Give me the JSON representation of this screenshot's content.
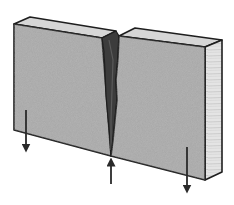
{
  "diagram": {
    "caption": "· · · ·· ·· ··· · ·· ·",
    "caption_note": "",
    "blocks": [
      {
        "name": "left-block",
        "face_color": "#a6a6a6",
        "top_color": "#d4d4d4"
      },
      {
        "name": "right-block",
        "face_color": "#a6a6a6",
        "top_color": "#d4d4d4",
        "side_color": "#e2e2e2"
      }
    ],
    "crack": {
      "color": "#3a3a3a"
    },
    "arrows": [
      {
        "name": "left-arrow",
        "direction": "down"
      },
      {
        "name": "center-arrow",
        "direction": "up"
      },
      {
        "name": "right-arrow",
        "direction": "down"
      }
    ],
    "colors": {
      "outline": "#1e1e1e",
      "face": "#a6a6a6",
      "top": "#d6d6d6",
      "side": "#e4e4e4",
      "crack": "#3c3c3c",
      "arrow": "#2a2a2a"
    }
  }
}
